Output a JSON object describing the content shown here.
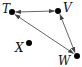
{
  "diagram": {
    "type": "directed-graph",
    "colors": {
      "node": "#000000",
      "edge": "#555555",
      "label": "#111111",
      "background": "#ffffff"
    },
    "nodes": [
      {
        "id": "T",
        "label": "T",
        "x": 12,
        "y": 12,
        "label_x": 2,
        "label_y": 13
      },
      {
        "id": "V",
        "label": "V",
        "x": 58,
        "y": 11,
        "label_x": 63,
        "label_y": 12
      },
      {
        "id": "X",
        "label": "X",
        "x": 29,
        "y": 43,
        "label_x": 15,
        "label_y": 52
      },
      {
        "id": "W",
        "label": "W",
        "x": 77,
        "y": 56,
        "label_x": 58,
        "label_y": 65
      }
    ],
    "edges": [
      {
        "from": "T",
        "to": "V",
        "bidirectional": true
      },
      {
        "from": "T",
        "to": "W",
        "bidirectional": true
      },
      {
        "from": "V",
        "to": "W",
        "bidirectional": true
      }
    ]
  }
}
